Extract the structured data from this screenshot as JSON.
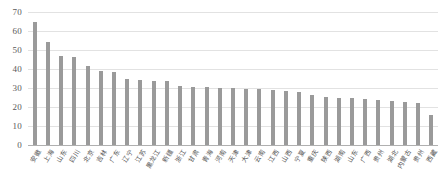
{
  "chart_data": {
    "type": "bar",
    "title": "",
    "subtitle": "",
    "xlabel": "",
    "ylabel": "",
    "ylim": [
      0,
      70
    ],
    "yticks": [
      0,
      10,
      20,
      30,
      40,
      50,
      60,
      70
    ],
    "grid": true,
    "legend": false,
    "bar_color": "#9a9a9a",
    "gridline_color": "#e2e2e2",
    "axis_color": "#b0b0b0",
    "categories": [
      "安徽",
      "上海",
      "山东",
      "四川",
      "北京",
      "吉林",
      "广东",
      "辽宁",
      "江苏",
      "黑龙江",
      "新疆",
      "浙江",
      "甘肃",
      "青海",
      "河南",
      "天津",
      "大津",
      "云南",
      "江西",
      "山西",
      "宁夏",
      "重庆",
      "陕西",
      "湖南",
      "山东",
      "广西",
      "贵州",
      "湖北",
      "内蒙古",
      "贵州",
      "西藏"
    ],
    "values": [
      65,
      54,
      47,
      46.5,
      41.5,
      39,
      38.5,
      35,
      34,
      33.5,
      33.5,
      31,
      30.5,
      30.5,
      30,
      30,
      29.5,
      29.5,
      29,
      28.5,
      28,
      26.5,
      25.5,
      25,
      24.5,
      24,
      23.5,
      23,
      22.5,
      22,
      16
    ]
  }
}
